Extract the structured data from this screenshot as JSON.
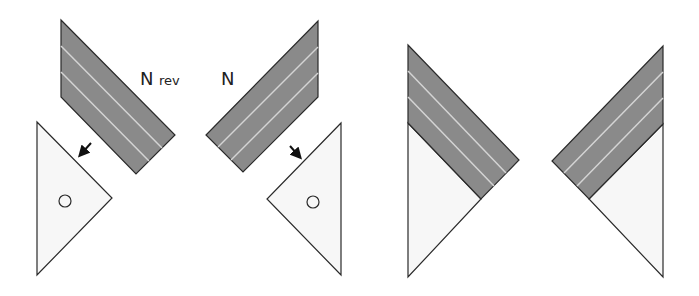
{
  "labels": {
    "n_rev_main": "N",
    "n_rev_sub": "rev",
    "n": "N"
  },
  "colors": {
    "dark_fill": "#8a8a8a",
    "stripe": "#d4d4d4",
    "light_fill": "#f7f7f7",
    "outline": "#2a2a2a",
    "arrow": "#111111"
  },
  "figure": {
    "panels": [
      {
        "name": "left-pair",
        "parts": [
          "dark-stripe-piece-nrev",
          "light-triangle-with-circle-left"
        ],
        "arrow": "down-left"
      },
      {
        "name": "middle-pair",
        "parts": [
          "dark-stripe-piece-n",
          "light-triangle-with-circle-right"
        ],
        "arrow": "down-right"
      },
      {
        "name": "assembled-left",
        "parts": [
          "dark-band",
          "light-triangle"
        ]
      },
      {
        "name": "assembled-right",
        "parts": [
          "dark-band",
          "light-triangle"
        ]
      }
    ]
  }
}
